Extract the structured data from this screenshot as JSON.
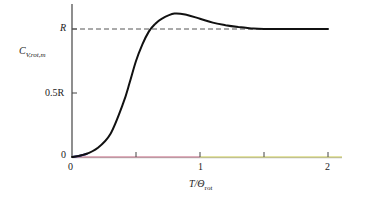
{
  "chart_data": {
    "type": "line",
    "title": "",
    "xlabel": "T/Θ_rot",
    "xlabel_parts": {
      "main": "T/Θ",
      "sub": "rot"
    },
    "ylabel": "C_V,rot,m",
    "ylabel_parts": {
      "main": "C",
      "sub": "V,rot,m"
    },
    "xlim": [
      0,
      2.1
    ],
    "ylim": [
      0,
      1.2
    ],
    "x_ticks": [
      0,
      0.5,
      1,
      1.5,
      2
    ],
    "x_tick_labels": [
      "0",
      "",
      "1",
      "",
      "2"
    ],
    "y_ticks": [
      0,
      0.5,
      1
    ],
    "y_tick_labels": [
      "0",
      "0.5R",
      "R"
    ],
    "grid": false,
    "legend": null,
    "reference_line": {
      "y": 1,
      "label": "R",
      "style": "dashed"
    },
    "series": [
      {
        "name": "C_V,rot,m (in units of R)",
        "x": [
          0,
          0.1,
          0.2,
          0.3,
          0.4,
          0.45,
          0.5,
          0.55,
          0.6,
          0.65,
          0.7,
          0.8,
          0.9,
          1.0,
          1.1,
          1.2,
          1.3,
          1.4,
          1.5,
          1.75,
          2.0
        ],
        "y": [
          0,
          0.02,
          0.07,
          0.18,
          0.42,
          0.58,
          0.75,
          0.88,
          0.98,
          1.04,
          1.08,
          1.12,
          1.11,
          1.08,
          1.05,
          1.03,
          1.015,
          1.005,
          1.0,
          1.0,
          1.0
        ]
      }
    ]
  },
  "labels": {
    "y_R": "R",
    "y_half": "0.5R",
    "y_zero": "0",
    "x_zero": "0",
    "x_one": "1",
    "x_two": "2",
    "ylabel_main": "C",
    "ylabel_sub": "V,rot,m",
    "xlabel_main": "T/Θ",
    "xlabel_sub": "rot"
  },
  "colors": {
    "curve": "#111111",
    "axis": "#444444",
    "dashed": "#555555",
    "axis_tint_left": "#c0607a",
    "axis_tint_right": "#c8c84a",
    "curve_start": "#1a1a8a"
  }
}
